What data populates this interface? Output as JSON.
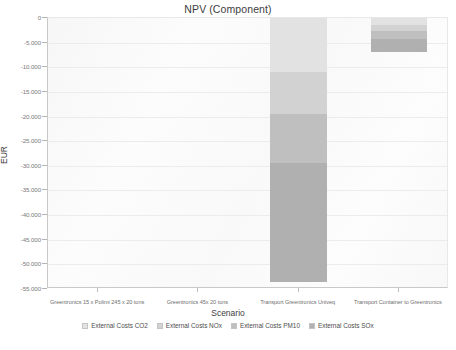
{
  "chart_data": {
    "type": "bar",
    "stacked": true,
    "title": "NPV (Component)",
    "xlabel": "Scenario",
    "ylabel": "EUR",
    "ylim": [
      -55000,
      0
    ],
    "ytick_step": 5000,
    "grid": true,
    "legend_position": "bottom",
    "categories": [
      "Greentronics 15 x Polimi 245 x 20 tons",
      "Greentronics 45x 20 tons",
      "Transport Greentronics Univeq",
      "Transport Container to Greentronics"
    ],
    "ytick_labels": [
      "0",
      "-5.000",
      "-10.000",
      "-15.000",
      "-20.000",
      "-25.000",
      "-30.000",
      "-35.000",
      "-40.000",
      "-45.000",
      "-50.000",
      "-55.000"
    ],
    "ytick_values": [
      0,
      -5000,
      -10000,
      -15000,
      -20000,
      -25000,
      -30000,
      -35000,
      -40000,
      -45000,
      -50000,
      -55000
    ],
    "series": [
      {
        "name": "External Costs CO2",
        "color": "#e2e2e2",
        "values": [
          0,
          0,
          -11000,
          -1500
        ]
      },
      {
        "name": "External Costs NOx",
        "color": "#d2d2d2",
        "values": [
          0,
          0,
          -8500,
          -1200
        ]
      },
      {
        "name": "External Costs PM10",
        "color": "#bfbfbf",
        "values": [
          0,
          0,
          -10000,
          -1600
        ]
      },
      {
        "name": "External Costs SOx",
        "color": "#b0b0b0",
        "values": [
          0,
          0,
          -24000,
          -2700
        ]
      }
    ],
    "totals": [
      0,
      0,
      -53500,
      -7000
    ]
  },
  "legend": {
    "items": [
      {
        "label": "External Costs CO2",
        "color": "#e2e2e2"
      },
      {
        "label": "External Costs NOx",
        "color": "#d2d2d2"
      },
      {
        "label": "External Costs PM10",
        "color": "#bfbfbf"
      },
      {
        "label": "External Costs SOx",
        "color": "#b0b0b0"
      }
    ]
  }
}
